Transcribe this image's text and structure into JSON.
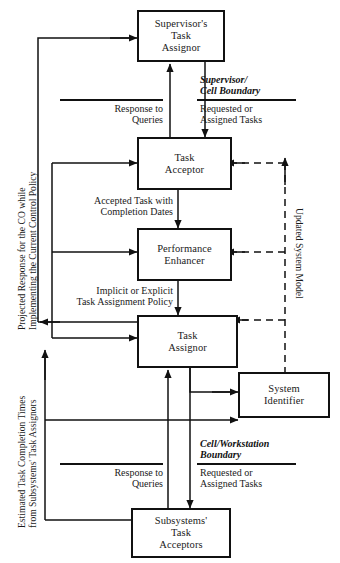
{
  "diagram": {
    "type": "block-flow-diagram",
    "colors": {
      "line": "#111111",
      "box_border": "#111111",
      "background": "#ffffff",
      "text": "#1a1a1a"
    },
    "nodes": [
      {
        "id": "supervisors-task-assignor",
        "label": "Supervisor's\nTask\nAssignor"
      },
      {
        "id": "task-acceptor",
        "label": "Task\nAcceptor"
      },
      {
        "id": "performance-enhancer",
        "label": "Performance\nEnhancer"
      },
      {
        "id": "task-assignor",
        "label": "Task\nAssignor"
      },
      {
        "id": "system-identifier",
        "label": "System\nIdentifier"
      },
      {
        "id": "subsystems-task-acceptors",
        "label": "Subsystems'\nTask\nAcceptors"
      }
    ],
    "edge_labels": [
      {
        "id": "response-to-queries-top",
        "text": "Response to\nQueries"
      },
      {
        "id": "requested-or-assigned-tasks-top",
        "text": "Requested or\nAssigned Tasks"
      },
      {
        "id": "accepted-task-with-completion-dates",
        "text": "Accepted Task with\nCompletion Dates"
      },
      {
        "id": "implicit-or-explicit-task-assignment-policy",
        "text": "Implicit or Explicit\nTask Assignment Policy"
      },
      {
        "id": "response-to-queries-bottom",
        "text": "Response to\nQueries"
      },
      {
        "id": "requested-or-assigned-tasks-bottom",
        "text": "Requested or\nAssigned Tasks"
      }
    ],
    "boundary_labels": [
      {
        "id": "supervisor-cell-boundary",
        "text": "Supervisor/\nCell Boundary"
      },
      {
        "id": "cell-workstation-boundary",
        "text": "Cell/Workstation\nBoundary"
      }
    ],
    "vertical_labels": [
      {
        "id": "projected-response-label",
        "text": "Projected Response for the CO while\nImplementing the Current Control Policy"
      },
      {
        "id": "estimated-task-completion-label",
        "text": "Estimated Task Completion Times\nfrom Subsystems' Task Assignors"
      },
      {
        "id": "updated-system-model-label",
        "text": "Updated System Model"
      }
    ]
  }
}
